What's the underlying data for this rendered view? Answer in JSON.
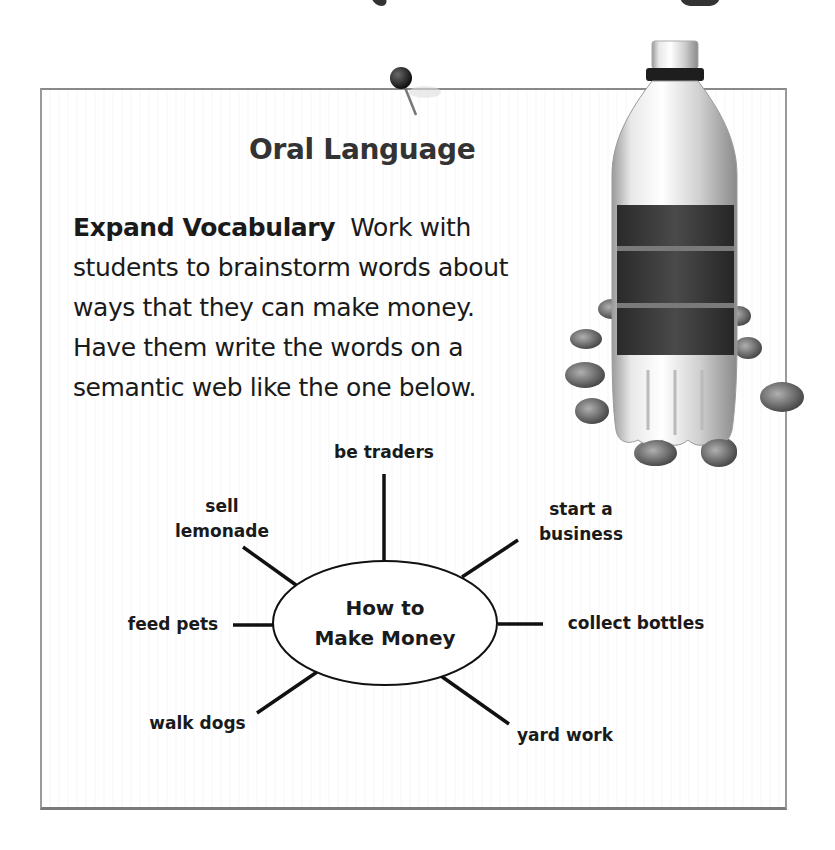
{
  "section": {
    "title": "Oral Language",
    "paragraph": {
      "bold_lead": "Expand Vocabulary",
      "lines": [
        "Work with",
        "students to brainstorm words about",
        "ways that they can make money.",
        "Have them write the words on a",
        "semantic web like the one below."
      ]
    }
  },
  "semantic_web": {
    "center": {
      "line1": "How to",
      "line2": "Make Money"
    },
    "spokes": [
      {
        "id": "be-traders",
        "lines": [
          "be traders"
        ]
      },
      {
        "id": "start-a-business",
        "lines": [
          "start a",
          "business"
        ]
      },
      {
        "id": "collect-bottles",
        "lines": [
          "collect bottles"
        ]
      },
      {
        "id": "yard-work",
        "lines": [
          "yard work"
        ]
      },
      {
        "id": "walk-dogs",
        "lines": [
          "walk dogs"
        ]
      },
      {
        "id": "feed-pets",
        "lines": [
          "feed pets"
        ]
      },
      {
        "id": "sell-lemonade",
        "lines": [
          "sell",
          "lemonade"
        ]
      }
    ]
  },
  "illustrations": {
    "pushpin": "pushpin-icon",
    "bottle": "plastic-bottle-with-coins"
  }
}
